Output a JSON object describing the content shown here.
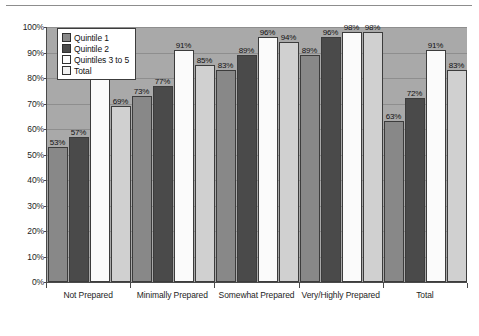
{
  "chart_data": {
    "type": "bar",
    "title": "",
    "xlabel": "",
    "ylabel": "",
    "ylim": [
      0,
      100
    ],
    "grid": true,
    "legend_position": "top-left-inside",
    "categories": [
      "Not Prepared",
      "Minimally Prepared",
      "Somewhat Prepared",
      "Very/Highly Prepared",
      "Total"
    ],
    "yticks": [
      "0%",
      "10%",
      "20%",
      "30%",
      "40%",
      "50%",
      "60%",
      "70%",
      "80%",
      "90%",
      "100%"
    ],
    "ytick_values": [
      0,
      10,
      20,
      30,
      40,
      50,
      60,
      70,
      80,
      90,
      100
    ],
    "series": [
      {
        "name": "Quintile 1",
        "color": "#888888",
        "values": [
          53,
          73,
          83,
          89,
          63
        ],
        "labels": [
          "53%",
          "73%",
          "83%",
          "89%",
          "63%"
        ]
      },
      {
        "name": "Quintile 2",
        "color": "#4a4a4a",
        "values": [
          57,
          77,
          89,
          96,
          72
        ],
        "labels": [
          "57%",
          "77%",
          "89%",
          "96%",
          "72%"
        ]
      },
      {
        "name": "Quintiles 3 to 5",
        "color": "#fbfbfb",
        "values": [
          80,
          91,
          96,
          98,
          91
        ],
        "labels": [
          "80%",
          "91%",
          "96%",
          "98%",
          "91%"
        ]
      },
      {
        "name": "Total",
        "color": "#d0d0d0",
        "values": [
          69,
          85,
          94,
          98,
          83
        ],
        "labels": [
          "69%",
          "85%",
          "94%",
          "98%",
          "83%"
        ]
      }
    ]
  },
  "colors": {
    "plot_background": "#a9a9a9",
    "gridline": "#8e8e8e",
    "axis": "#4a4a4a",
    "bar_outline": "#3c3c3c",
    "legend_background": "#ffffff",
    "page_background": "#ffffff"
  }
}
